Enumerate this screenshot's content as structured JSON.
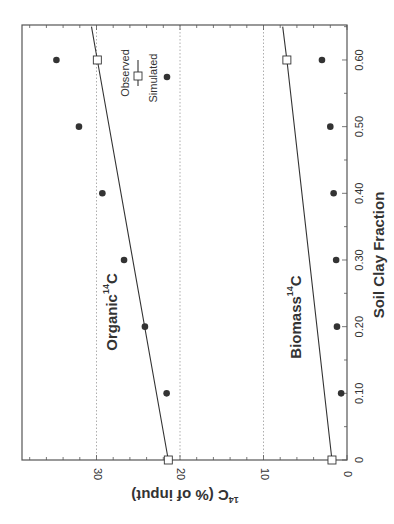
{
  "chart_data": {
    "type": "scatter",
    "orientation": "rotated 90 degrees clockwise",
    "xlabel": "Soil Clay Fraction",
    "ylabel": "14C (% of input)",
    "ylabel_superscript": "14",
    "ylabel_main": "C (% of input)",
    "xlim": [
      0,
      0.65
    ],
    "ylim": [
      0,
      39
    ],
    "x_ticks": [
      0,
      0.1,
      0.2,
      0.3,
      0.4,
      0.5,
      0.6
    ],
    "x_tick_labels": [
      "0",
      "0.10",
      "0.20",
      "0.30",
      "0.40",
      "0.50",
      "0.60"
    ],
    "y_ticks": [
      0,
      10,
      20,
      30
    ],
    "y_tick_labels": [
      "0",
      "10",
      "20",
      "30"
    ],
    "grid": {
      "horizontal_dotted_at": [
        10,
        20,
        30
      ]
    },
    "legend": {
      "position": "upper right (rotated)",
      "entries": [
        {
          "label": "Observed",
          "marker": "line-with-open-square"
        },
        {
          "label": "Simulated",
          "marker": "filled-circle"
        }
      ]
    },
    "series_labels": [
      {
        "text": "Organic",
        "superscript": "14",
        "suffix": "C"
      },
      {
        "text": "Biomass",
        "superscript": "14",
        "suffix": "C"
      }
    ],
    "series": [
      {
        "name": "Organic 14C dots",
        "style": "filled-circle",
        "x": [
          0.1,
          0.2,
          0.3,
          0.4,
          0.5,
          0.6
        ],
        "values": [
          21.6,
          24.2,
          26.7,
          29.3,
          32.1,
          34.8
        ]
      },
      {
        "name": "Organic 14C line",
        "style": "line-with-open-square-endpoints",
        "x": [
          0,
          0.6,
          0.65
        ],
        "values": [
          21.4,
          29.9,
          30.6
        ]
      },
      {
        "name": "Biomass 14C dots",
        "style": "filled-circle",
        "x": [
          0.1,
          0.2,
          0.3,
          0.4,
          0.5,
          0.6
        ],
        "values": [
          0.7,
          1.2,
          1.3,
          1.6,
          2.0,
          3.0
        ]
      },
      {
        "name": "Biomass 14C line",
        "style": "line-with-open-square-endpoints",
        "x": [
          0,
          0.6,
          0.65
        ],
        "values": [
          1.8,
          7.2,
          7.7
        ]
      }
    ]
  },
  "colors": {
    "axis": "#555555",
    "marker": "#333333",
    "line": "#333333",
    "grid": "#999999",
    "text": "#333333"
  }
}
